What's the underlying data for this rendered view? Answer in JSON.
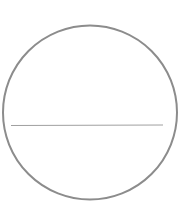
{
  "diagram": {
    "circle": {
      "cx": 90,
      "cy": 112.5,
      "r": 87,
      "stroke": "#8c8c8c",
      "stroke_width": 2
    },
    "chord": {
      "x1": 11,
      "y1": 125.5,
      "x2": 163,
      "y2": 125,
      "stroke": "#a0a0a0",
      "stroke_width": 1
    }
  }
}
